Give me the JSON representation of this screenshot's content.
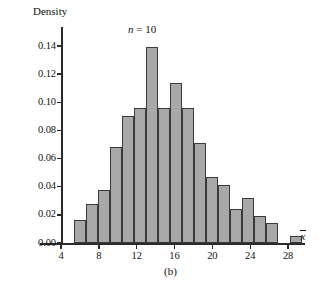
{
  "figure": {
    "panel_label": "(b)",
    "annotation": "n = 10",
    "annotation_symbol": "n",
    "annotation_rest": " = 10"
  },
  "chart_data": {
    "type": "bar",
    "title": "",
    "subtitle": "",
    "annotation": "n = 10",
    "panel": "(b)",
    "xlabel": "x̄",
    "ylabel": "Density",
    "xlim": [
      2.0,
      30.0
    ],
    "ylim": [
      0.0,
      0.148
    ],
    "grid": false,
    "legend": false,
    "bin_width": 1.27,
    "x_ticks": [
      4,
      8,
      12,
      16,
      20,
      24,
      28
    ],
    "x_tick_labels": [
      "4",
      "8",
      "12",
      "16",
      "20",
      "24",
      "28"
    ],
    "y_ticks": [
      0.0,
      0.02,
      0.04,
      0.06,
      0.08,
      0.1,
      0.12,
      0.14
    ],
    "y_tick_labels": [
      "0.00",
      "0.02",
      "0.04",
      "0.06",
      "0.08",
      "0.10",
      "0.12",
      "0.14"
    ],
    "bar_color": "#a8a8a8",
    "bar_edge_color": "#3a3a3a",
    "bins": [
      {
        "x_left": 5.4,
        "x_right": 6.67,
        "density": 0.016
      },
      {
        "x_left": 6.67,
        "x_right": 7.94,
        "density": 0.028
      },
      {
        "x_left": 7.94,
        "x_right": 9.21,
        "density": 0.038
      },
      {
        "x_left": 9.21,
        "x_right": 10.48,
        "density": 0.068
      },
      {
        "x_left": 10.48,
        "x_right": 11.75,
        "density": 0.09
      },
      {
        "x_left": 11.75,
        "x_right": 13.02,
        "density": 0.096
      },
      {
        "x_left": 13.02,
        "x_right": 14.29,
        "density": 0.139
      },
      {
        "x_left": 14.29,
        "x_right": 15.56,
        "density": 0.096
      },
      {
        "x_left": 15.56,
        "x_right": 16.83,
        "density": 0.114
      },
      {
        "x_left": 16.83,
        "x_right": 18.1,
        "density": 0.096
      },
      {
        "x_left": 18.1,
        "x_right": 19.37,
        "density": 0.071
      },
      {
        "x_left": 19.37,
        "x_right": 20.64,
        "density": 0.047
      },
      {
        "x_left": 20.64,
        "x_right": 21.91,
        "density": 0.041
      },
      {
        "x_left": 21.91,
        "x_right": 23.18,
        "density": 0.024
      },
      {
        "x_left": 23.18,
        "x_right": 24.45,
        "density": 0.032
      },
      {
        "x_left": 24.45,
        "x_right": 25.72,
        "density": 0.019
      },
      {
        "x_left": 25.72,
        "x_right": 26.99,
        "density": 0.014
      },
      {
        "x_left": 28.26,
        "x_right": 29.53,
        "density": 0.005
      }
    ]
  }
}
